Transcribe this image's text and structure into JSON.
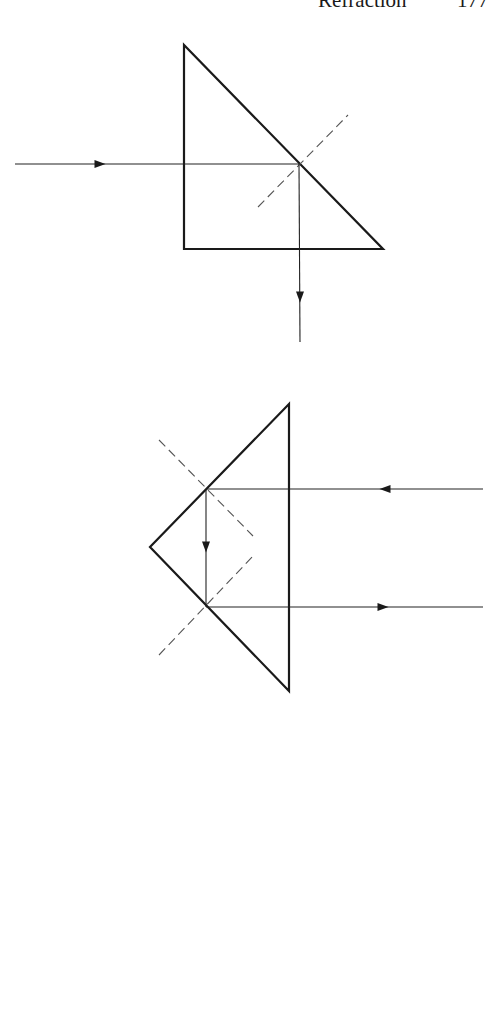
{
  "running_head": {
    "section": "Refraction",
    "page_number": "177"
  },
  "figures": [
    {
      "id": "right-angle-prism-single-reflection",
      "description": "Right-angle prism; horizontal ray enters vertical face, totally reflects at hypotenuse, exits downward through base",
      "prism_vertices": [
        [
          184,
          45
        ],
        [
          184,
          249
        ],
        [
          383,
          249
        ]
      ],
      "incident_ray": {
        "from": [
          15,
          164
        ],
        "to": [
          299,
          164
        ],
        "arrow_at": [
          100,
          164
        ],
        "direction": "right"
      },
      "reflected_ray": {
        "from": [
          299,
          164
        ],
        "to": [
          300,
          342
        ],
        "arrow_at": [
          300,
          297
        ],
        "direction": "down"
      },
      "normal": {
        "from": [
          258,
          207
        ],
        "to": [
          348,
          115
        ],
        "style": "dashed"
      }
    },
    {
      "id": "right-angle-prism-double-reflection",
      "description": "Porro-type right-angle prism; ray enters hypotenuse face from right, reflects twice and returns parallel to the right",
      "prism_vertices": [
        [
          289,
          404
        ],
        [
          150,
          547
        ],
        [
          289,
          691
        ]
      ],
      "incident_ray": {
        "from": [
          483,
          489
        ],
        "to": [
          206,
          489
        ],
        "arrow_at": [
          385,
          489
        ],
        "direction": "left"
      },
      "internal_ray": {
        "from": [
          206,
          489
        ],
        "to": [
          206,
          607
        ],
        "arrow_at": [
          206,
          547
        ],
        "direction": "down"
      },
      "exit_ray": {
        "from": [
          206,
          607
        ],
        "to": [
          483,
          607
        ],
        "arrow_at": [
          383,
          607
        ],
        "direction": "right"
      },
      "normals": [
        {
          "from": [
            159,
            440
          ],
          "to": [
            253,
            536
          ],
          "style": "dashed"
        },
        {
          "from": [
            159,
            655
          ],
          "to": [
            254,
            555
          ],
          "style": "dashed"
        }
      ]
    }
  ]
}
